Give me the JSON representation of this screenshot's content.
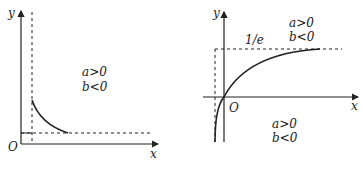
{
  "figure": {
    "left_graph": {
      "axis_labels": {
        "x": "x",
        "y": "y",
        "origin": "O"
      },
      "condition_lines": [
        "a>0",
        "b<0"
      ],
      "curve": "decreasing curve approaching horizontal asymptote from above, starting at vertical asymptote"
    },
    "right_graph": {
      "axis_labels": {
        "x": "x",
        "y": "y",
        "origin": "O"
      },
      "asymptote_label": "1/e",
      "condition_lines_top": [
        "a>0",
        "b<0"
      ],
      "condition_lines_bottom": [
        "a>0",
        "b<0"
      ],
      "curve": "increasing curve through origin approaching horizontal asymptote 1/e"
    }
  }
}
